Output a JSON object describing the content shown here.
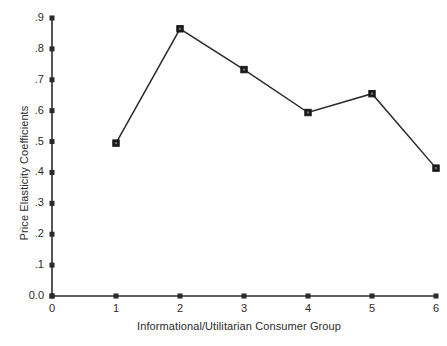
{
  "chart_data": {
    "type": "line",
    "title": "",
    "subtitle": "",
    "xlabel": "Informational/Utilitarian Consumer Group",
    "ylabel": "Price Elasticity Coefficients",
    "x": [
      1,
      2,
      3,
      4,
      5,
      6
    ],
    "values": [
      0.495,
      0.865,
      0.733,
      0.594,
      0.655,
      0.414
    ],
    "categories": [
      "1",
      "2",
      "3",
      "4",
      "5",
      "6"
    ],
    "series": [
      {
        "name": "Price Elasticity Coefficients",
        "values": [
          0.495,
          0.865,
          0.733,
          0.594,
          0.655,
          0.414
        ]
      }
    ],
    "xlim": [
      0,
      6
    ],
    "ylim": [
      0.0,
      0.9
    ],
    "xticks": [
      "0",
      "1",
      "2",
      "3",
      "4",
      "5",
      "6"
    ],
    "xtick_values": [
      0,
      1,
      2,
      3,
      4,
      5,
      6
    ],
    "yticks": [
      "0.0",
      ".1",
      ".2",
      ".3",
      ".4",
      ".5",
      ".6",
      ".7",
      ".8",
      ".9"
    ],
    "ytick_values": [
      0.0,
      0.1,
      0.2,
      0.3,
      0.4,
      0.5,
      0.6,
      0.7,
      0.8,
      0.9
    ],
    "grid": false,
    "legend": false,
    "legend_position": "none",
    "marker": "square",
    "annotations": [],
    "colors": {
      "background": "#ffffff",
      "line": "#2b2b2b",
      "marker": "#1a1a1a",
      "axis": "#2b2b2b",
      "text": "#2b2b2b"
    }
  }
}
